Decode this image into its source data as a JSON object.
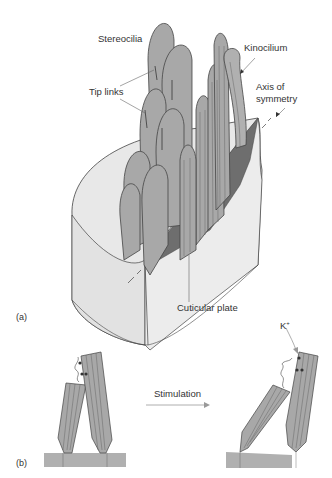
{
  "figure": {
    "panel_a": {
      "label": "(a)",
      "annotations": {
        "stereocilia": "Stereocilia",
        "kinocilium": "Kinocilium",
        "tip_links": "Tip links",
        "axis_line1": "Axis of",
        "axis_line2": "symmetry",
        "cuticular_plate": "Cuticular plate"
      }
    },
    "panel_b": {
      "label": "(b)",
      "arrow_label": "Stimulation",
      "ion_label": "K",
      "ion_charge": "+"
    },
    "colors": {
      "stereocilia_fill": "#a8a8a8",
      "cell_body_fill": "#e6e6e6",
      "cuticular_plate_fill": "#6e6e6e",
      "outline": "#444444",
      "base_fill": "#b0b0b0",
      "arrow_gray": "#999999"
    }
  }
}
